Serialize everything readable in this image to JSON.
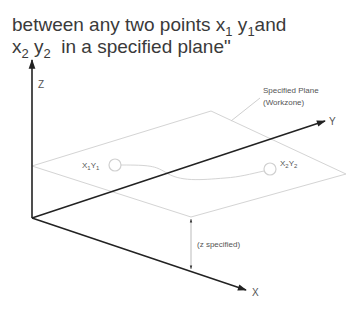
{
  "caption": {
    "line1": {
      "text_before": "between any two points x",
      "sub1": "1",
      "mid": " y",
      "sub2": "1",
      "text_after": "and"
    },
    "line2": {
      "x": "x",
      "sub1": "2",
      "y": " y",
      "sub2": "2",
      "text_after": "  in a specified plane\""
    }
  },
  "diagram": {
    "axes": {
      "z_label": "Z",
      "y_label": "Y",
      "x_label": "X"
    },
    "plane_label_line1": "Specified Plane",
    "plane_label_line2": "(Workzone)",
    "point1": {
      "x": "X",
      "xs": "1",
      "y": "Y",
      "ys": "1"
    },
    "point2": {
      "x": "X",
      "xs": "2",
      "y": "Y",
      "ys": "2"
    },
    "z_offset_label": "(z specified)",
    "colors": {
      "axis": "#222222",
      "plane": "#d0d0d0",
      "text": "#555555"
    }
  }
}
